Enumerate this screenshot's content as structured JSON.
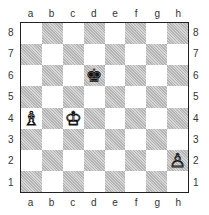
{
  "board": {
    "files": [
      "a",
      "b",
      "c",
      "d",
      "e",
      "f",
      "g",
      "h"
    ],
    "ranks": [
      "8",
      "7",
      "6",
      "5",
      "4",
      "3",
      "2",
      "1"
    ],
    "pieces": [
      {
        "square": "d6",
        "color": "black",
        "type": "king",
        "glyph": "♚"
      },
      {
        "square": "a4",
        "color": "white",
        "type": "bishop",
        "glyph": "♗"
      },
      {
        "square": "c4",
        "color": "white",
        "type": "king",
        "glyph": "♔"
      },
      {
        "square": "h2",
        "color": "white",
        "type": "pawn",
        "glyph": "♙"
      }
    ],
    "colors": {
      "light": "#ffffff",
      "dark": "#c9c9c9",
      "border": "#222222"
    }
  }
}
